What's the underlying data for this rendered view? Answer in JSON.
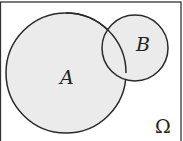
{
  "diagram": {
    "type": "venn",
    "universe_label": "Ω",
    "sets": [
      {
        "name": "A",
        "label": "A"
      },
      {
        "name": "B",
        "label": "B"
      }
    ],
    "colors": {
      "fill": "#ebebeb",
      "stroke": "#2a2a2a",
      "background": "#ffffff"
    }
  }
}
